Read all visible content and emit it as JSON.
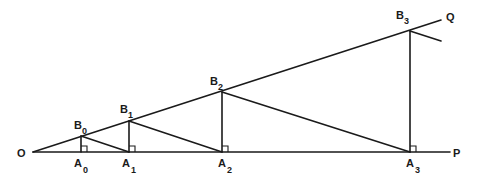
{
  "diagram": {
    "type": "geometry-construction",
    "points": {
      "O": {
        "label": "O",
        "x": 33,
        "y": 152
      },
      "P": {
        "label": "P",
        "x": 450,
        "y": 152
      },
      "Q": {
        "label": "Q",
        "x": 441,
        "y": 20
      },
      "A0": {
        "label": "A",
        "sub": "0",
        "x": 81,
        "y": 152
      },
      "A1": {
        "label": "A",
        "sub": "1",
        "x": 129,
        "y": 152
      },
      "A2": {
        "label": "A",
        "sub": "2",
        "x": 222,
        "y": 152
      },
      "A3": {
        "label": "A",
        "sub": "3",
        "x": 410,
        "y": 152
      },
      "B0": {
        "label": "B",
        "sub": "0",
        "x": 81,
        "y": 136
      },
      "B1": {
        "label": "B",
        "sub": "1",
        "x": 129,
        "y": 121
      },
      "B2": {
        "label": "B",
        "sub": "2",
        "x": 222,
        "y": 92
      },
      "B3": {
        "label": "B",
        "sub": "3",
        "x": 410,
        "y": 31
      }
    },
    "labels": {
      "O": "O",
      "P": "P",
      "Q": "Q",
      "A": "A",
      "B": "B",
      "s0": "0",
      "s1": "1",
      "s2": "2",
      "s3": "3"
    },
    "right_angle_marks": [
      "A0",
      "A1",
      "A2",
      "A3"
    ],
    "stroke_color": "#1a1a1a",
    "background": "#ffffff"
  }
}
